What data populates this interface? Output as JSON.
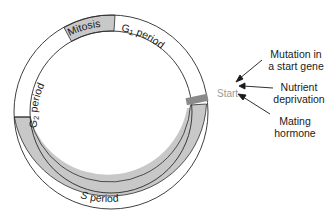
{
  "diagram": {
    "type": "cell-cycle",
    "phases": [
      {
        "label": "Mitosis",
        "fill": "#c8c8c8"
      },
      {
        "label": "G1 period",
        "main": "G",
        "sub": "1",
        "rest": " period",
        "fill": "#ffffff"
      },
      {
        "label": "S period",
        "main": "S",
        "rest": " period",
        "fill": "#c8c8c8"
      },
      {
        "label": "G2 period",
        "main": "G",
        "sub": "2",
        "rest": " period",
        "fill": "#ffffff"
      }
    ],
    "start_marker": {
      "label": "Start",
      "color": "#8a8a8a"
    },
    "signals": [
      {
        "line1": "Mutation in",
        "line2": "a start gene"
      },
      {
        "line1": "Nutrient",
        "line2": "deprivation"
      },
      {
        "line1": "Mating",
        "line2": "hormone"
      }
    ],
    "colors": {
      "ring_stroke": "#2a2a2a",
      "shaded": "#c8c8c8",
      "start_bar": "#8a8a8a",
      "start_text": "#9a9a9a"
    }
  }
}
